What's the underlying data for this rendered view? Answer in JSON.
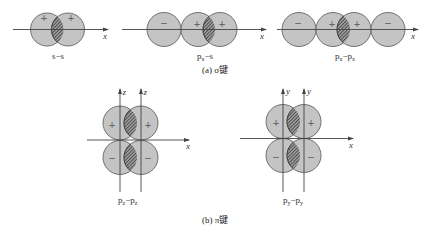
{
  "figure": {
    "sigma": {
      "caption": "(a) σ键",
      "axis_label": "x",
      "diagrams": [
        {
          "id": "s-s",
          "label_main": "s−s",
          "label_parts": [
            "s",
            "",
            "−s",
            ""
          ],
          "signs": [
            "+",
            "+"
          ]
        },
        {
          "id": "px-s",
          "label_parts": [
            "p",
            "x",
            "−s",
            ""
          ],
          "signs": [
            "−",
            "+",
            "+"
          ]
        },
        {
          "id": "px-px",
          "label_parts": [
            "p",
            "x",
            "−p",
            "x"
          ],
          "signs": [
            "−",
            "+",
            "+",
            "−"
          ]
        }
      ]
    },
    "pi": {
      "caption": "(b) π键",
      "diagrams": [
        {
          "id": "pz-pz",
          "vertical_axis_label": "z",
          "horizontal_axis_label": "x",
          "label_parts": [
            "p",
            "z",
            "−p",
            "z"
          ],
          "signs_top": [
            "+",
            "+"
          ],
          "signs_bottom": [
            "−",
            "−"
          ]
        },
        {
          "id": "py-py",
          "vertical_axis_label": "y",
          "horizontal_axis_label": "x",
          "label_parts": [
            "p",
            "y",
            "−p",
            "y"
          ],
          "signs_top": [
            "+",
            "+"
          ],
          "signs_bottom": [
            "−",
            "−"
          ]
        }
      ]
    }
  },
  "colors": {
    "lobe_fill": "#c4c4c4",
    "lobe_stroke": "#555555",
    "hatch": "#333333",
    "axis": "#444444"
  }
}
